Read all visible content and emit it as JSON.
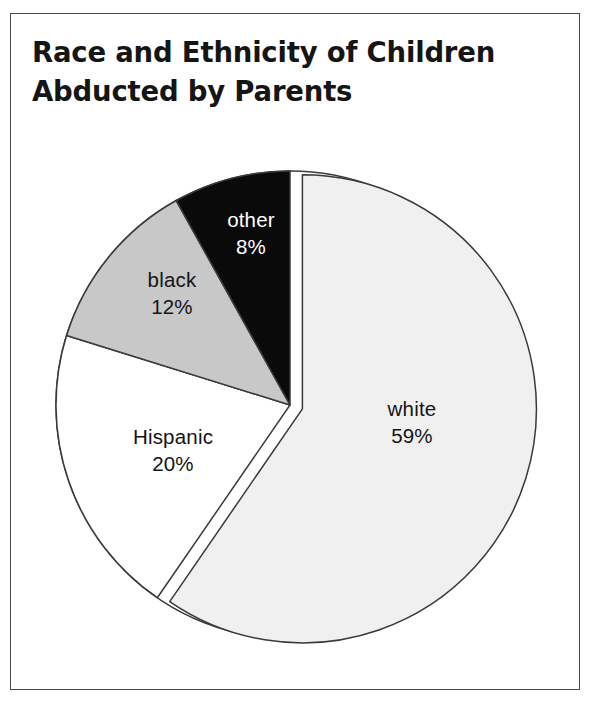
{
  "figure": {
    "title_lines": [
      "Race and Ethnicity of Children",
      "Abducted by Parents"
    ],
    "title_full": "Race and Ethnicity of Children Abducted by Parents",
    "frame_color": "#4a4a4a",
    "background_color": "#ffffff"
  },
  "chart_data": {
    "type": "pie",
    "title": "Race and Ethnicity of Children Abducted by Parents",
    "xlabel": "",
    "ylabel": "",
    "categories": [
      "white",
      "Hispanic",
      "black",
      "other"
    ],
    "values": [
      59,
      20,
      12,
      8
    ],
    "value_unit": "%",
    "value_labels": [
      "59%",
      "20%",
      "12%",
      "8%"
    ],
    "total": 99,
    "start_angle_deg": 0,
    "direction": "clockwise",
    "legend": "none",
    "grid": false,
    "slices": [
      {
        "label": "white",
        "value": 59,
        "value_label": "59%",
        "color": "#f0f0f0",
        "edge_color": "#3a3a3a",
        "text_color": "#141414",
        "exploded": true,
        "label_x": 412,
        "label_y": 416
      },
      {
        "label": "Hispanic",
        "value": 20,
        "value_label": "20%",
        "color": "#ffffff",
        "edge_color": "#3a3a3a",
        "text_color": "#141414",
        "exploded": false,
        "label_x": 173,
        "label_y": 444
      },
      {
        "label": "black",
        "value": 12,
        "value_label": "12%",
        "color": "#c8c8c8",
        "edge_color": "#3a3a3a",
        "text_color": "#141414",
        "exploded": false,
        "label_x": 172,
        "label_y": 287
      },
      {
        "label": "other",
        "value": 8,
        "value_label": "8%",
        "color": "#0a0a0a",
        "edge_color": "#3a3a3a",
        "text_color": "#ffffff",
        "exploded": false,
        "label_x": 251,
        "label_y": 227
      }
    ]
  }
}
